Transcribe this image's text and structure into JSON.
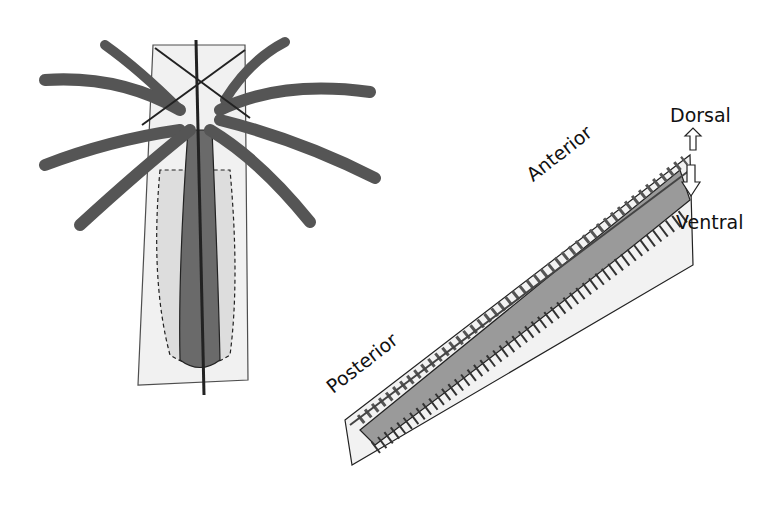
{
  "figure": {
    "left_panel": {
      "name": "radial-symmetry-polyp"
    },
    "right_panel": {
      "name": "bilateral-symmetry-worm",
      "labels": {
        "dorsal": "Dorsal",
        "ventral": "Ventral",
        "anterior": "Anterior",
        "posterior": "Posterior"
      }
    },
    "colors": {
      "tissue_dark": "#6a6a6a",
      "plane": "#e6e6e6",
      "worm_body": "#9a9a9a",
      "outline": "#222222"
    }
  }
}
